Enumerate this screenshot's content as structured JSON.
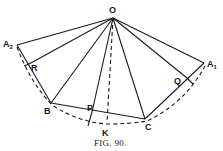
{
  "figure": {
    "caption": "FIG. 90.",
    "points": {
      "O": {
        "label": "O",
        "x": 113,
        "y": 17
      },
      "A2": {
        "label": "A",
        "sub": "2",
        "x": 17,
        "y": 45
      },
      "R": {
        "label": "R",
        "x": 29,
        "y": 64
      },
      "B": {
        "label": "B",
        "x": 51,
        "y": 103
      },
      "P": {
        "label": "P",
        "x": 92,
        "y": 110
      },
      "K": {
        "label": "K",
        "x": 107,
        "y": 122
      },
      "C": {
        "label": "C",
        "x": 145,
        "y": 119
      },
      "Q": {
        "label": "Q",
        "x": 187,
        "y": 77
      },
      "A1": {
        "label": "A",
        "sub": "1",
        "x": 204,
        "y": 63
      }
    },
    "solid_segments": [
      [
        "O",
        "A2"
      ],
      [
        "O",
        "R"
      ],
      [
        "O",
        "B"
      ],
      [
        "O",
        "P"
      ],
      [
        "O",
        "C"
      ],
      [
        "O",
        "Q"
      ],
      [
        "O",
        "A1"
      ],
      [
        "A2",
        "B"
      ],
      [
        "B",
        "C"
      ],
      [
        "C",
        "A1"
      ]
    ],
    "dashed_segments": [
      [
        "O",
        "K"
      ]
    ],
    "dashed_arc": "A2-B-K-C-A1",
    "line_color": "#1a1a1a",
    "background": "#ffffff"
  }
}
